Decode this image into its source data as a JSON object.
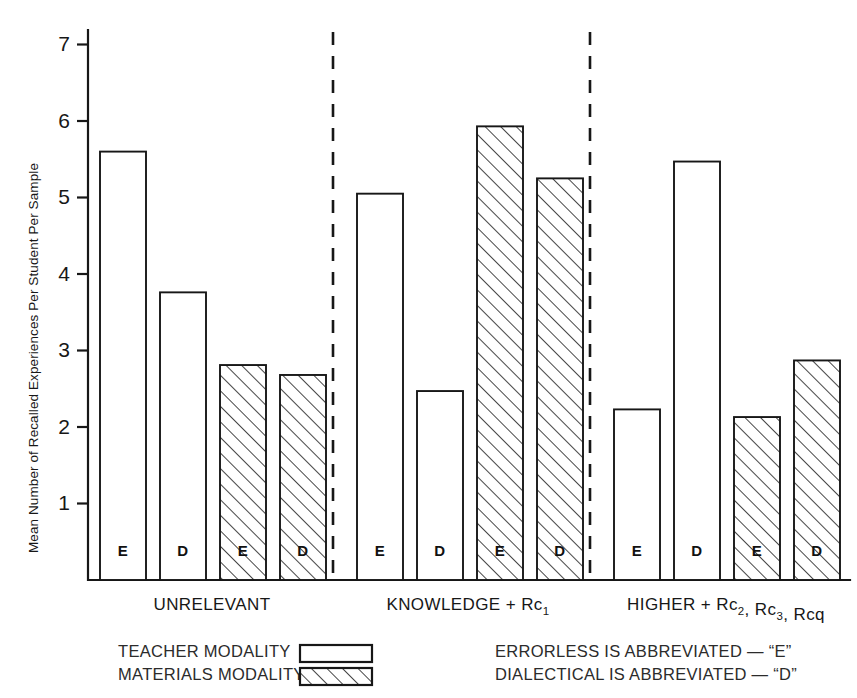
{
  "chart_data": {
    "type": "bar",
    "title": "",
    "xlabel": "",
    "ylabel": "Mean Number of Recalled Experiences Per Student  Per Sample",
    "ylim": [
      0,
      7.2
    ],
    "yticks": [
      1,
      2,
      3,
      4,
      5,
      6,
      7
    ],
    "ytick_labels": [
      "1",
      "2",
      "3",
      "4",
      "5",
      "6",
      "7"
    ],
    "grid": false,
    "legend_position": "below-axis-left",
    "groups": [
      {
        "label": "UNRELEVANT",
        "label_parts": [
          {
            "text": "UNRELEVANT",
            "sub": ""
          }
        ]
      },
      {
        "label": "KNOWLEDGE + Rc1",
        "label_parts": [
          {
            "text": "KNOWLEDGE + Rc",
            "sub": "1"
          }
        ]
      },
      {
        "label": "HIGHER + Rc2, Rc3, Rcq",
        "label_parts": [
          {
            "text": "HIGHER + Rc",
            "sub": "2"
          },
          {
            "text": ", Rc",
            "sub": "3"
          },
          {
            "text": ", Rcq",
            "sub": ""
          }
        ]
      }
    ],
    "categories": [
      "UNRELEVANT / Teacher / E",
      "UNRELEVANT / Teacher / D",
      "UNRELEVANT / Materials / E",
      "UNRELEVANT / Materials / D",
      "KNOWLEDGE + Rc1 / Teacher / E",
      "KNOWLEDGE + Rc1 / Teacher / D",
      "KNOWLEDGE + Rc1 / Materials / E",
      "KNOWLEDGE + Rc1 / Materials / D",
      "HIGHER + Rc2, Rc3, Rcq / Teacher / E",
      "HIGHER + Rc2, Rc3, Rcq / Teacher / D",
      "HIGHER + Rc2, Rc3, Rcq / Materials / E",
      "HIGHER + Rc2, Rc3, Rcq / Materials / D"
    ],
    "series": [
      {
        "name": "TEACHER MODALITY",
        "style": "open",
        "values": [
          5.6,
          3.76,
          null,
          null,
          5.05,
          2.47,
          null,
          null,
          2.23,
          5.47,
          null,
          null
        ]
      },
      {
        "name": "MATERIALS MODALITY",
        "style": "hatched",
        "values": [
          null,
          null,
          2.81,
          2.68,
          null,
          null,
          5.93,
          5.25,
          null,
          null,
          2.13,
          2.87
        ]
      }
    ],
    "bars": [
      {
        "group": 0,
        "modality": "TEACHER MODALITY",
        "letter": "E",
        "value": 5.6,
        "style": "open"
      },
      {
        "group": 0,
        "modality": "TEACHER MODALITY",
        "letter": "D",
        "value": 3.76,
        "style": "open"
      },
      {
        "group": 0,
        "modality": "MATERIALS MODALITY",
        "letter": "E",
        "value": 2.81,
        "style": "hatched"
      },
      {
        "group": 0,
        "modality": "MATERIALS MODALITY",
        "letter": "D",
        "value": 2.68,
        "style": "hatched"
      },
      {
        "group": 1,
        "modality": "TEACHER MODALITY",
        "letter": "E",
        "value": 5.05,
        "style": "open"
      },
      {
        "group": 1,
        "modality": "TEACHER MODALITY",
        "letter": "D",
        "value": 2.47,
        "style": "open"
      },
      {
        "group": 1,
        "modality": "MATERIALS MODALITY",
        "letter": "E",
        "value": 5.93,
        "style": "hatched"
      },
      {
        "group": 1,
        "modality": "MATERIALS MODALITY",
        "letter": "D",
        "value": 5.25,
        "style": "hatched"
      },
      {
        "group": 2,
        "modality": "TEACHER MODALITY",
        "letter": "E",
        "value": 2.23,
        "style": "open"
      },
      {
        "group": 2,
        "modality": "TEACHER MODALITY",
        "letter": "D",
        "value": 5.47,
        "style": "open"
      },
      {
        "group": 2,
        "modality": "MATERIALS MODALITY",
        "letter": "E",
        "value": 2.13,
        "style": "hatched"
      },
      {
        "group": 2,
        "modality": "MATERIALS MODALITY",
        "letter": "D",
        "value": 2.87,
        "style": "hatched"
      }
    ],
    "legend": [
      {
        "label": "TEACHER MODALITY",
        "style": "open"
      },
      {
        "label": "MATERIALS MODALITY",
        "style": "hatched"
      }
    ],
    "notes": [
      "ERRORLESS IS ABBREVIATED — “E”",
      "DIALECTICAL IS ABBREVIATED — “D”"
    ],
    "colors": {
      "ink": "#171717",
      "background": "#ffffff",
      "note_text": "#2b2b2b"
    }
  }
}
